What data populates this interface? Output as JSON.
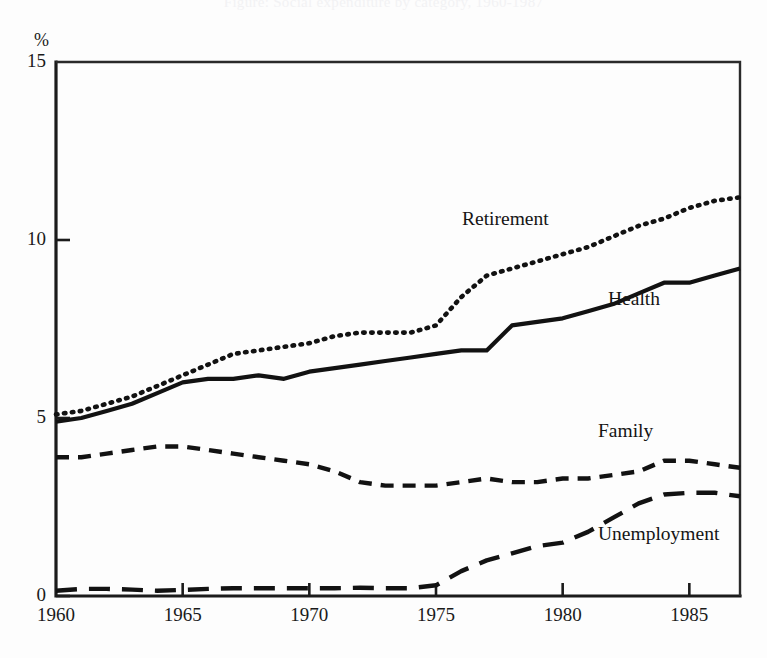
{
  "figure": {
    "cropped_title": "Figure: Social expenditure by category, 1960-1987",
    "percent_symbol": "%"
  },
  "chart_data": {
    "type": "line",
    "title": "",
    "subtitle": "",
    "xlabel": "",
    "ylabel": "%",
    "xlim": [
      1960,
      1987
    ],
    "ylim": [
      0,
      15
    ],
    "yticks": [
      0,
      5,
      10,
      15
    ],
    "xticks": [
      1960,
      1965,
      1970,
      1975,
      1980,
      1985
    ],
    "grid": false,
    "legend_position": "inline-annotations",
    "x": [
      1960,
      1961,
      1962,
      1963,
      1964,
      1965,
      1966,
      1967,
      1968,
      1969,
      1970,
      1971,
      1972,
      1973,
      1974,
      1975,
      1976,
      1977,
      1978,
      1979,
      1980,
      1981,
      1982,
      1983,
      1984,
      1985,
      1986,
      1987
    ],
    "series": [
      {
        "name": "Retirement",
        "style": "dotted",
        "label_x": 1972,
        "label_y": 10.2,
        "values": [
          5.1,
          5.2,
          5.4,
          5.6,
          5.9,
          6.2,
          6.5,
          6.8,
          6.9,
          7.0,
          7.1,
          7.3,
          7.4,
          7.4,
          7.4,
          7.6,
          8.4,
          9.0,
          9.2,
          9.4,
          9.6,
          9.8,
          10.1,
          10.4,
          10.6,
          10.9,
          11.1,
          11.2
        ]
      },
      {
        "name": "Health",
        "style": "solid",
        "label_x": 1981,
        "label_y": 8.6,
        "values": [
          4.9,
          5.0,
          5.2,
          5.4,
          5.7,
          6.0,
          6.1,
          6.1,
          6.2,
          6.1,
          6.3,
          6.4,
          6.5,
          6.6,
          6.7,
          6.8,
          6.9,
          6.9,
          7.6,
          7.7,
          7.8,
          8.0,
          8.2,
          8.5,
          8.8,
          8.8,
          9.0,
          9.2
        ]
      },
      {
        "name": "Family",
        "style": "short-dash",
        "label_x": 1980,
        "label_y": 4.4,
        "values": [
          3.9,
          3.9,
          4.0,
          4.1,
          4.2,
          4.2,
          4.1,
          4.0,
          3.9,
          3.8,
          3.7,
          3.5,
          3.2,
          3.1,
          3.1,
          3.1,
          3.2,
          3.3,
          3.2,
          3.2,
          3.3,
          3.3,
          3.4,
          3.5,
          3.8,
          3.8,
          3.7,
          3.6
        ]
      },
      {
        "name": "Unemployment",
        "style": "long-dash",
        "label_x": 1980,
        "label_y": 1.4,
        "values": [
          0.15,
          0.2,
          0.2,
          0.18,
          0.15,
          0.17,
          0.2,
          0.22,
          0.22,
          0.22,
          0.22,
          0.22,
          0.23,
          0.22,
          0.22,
          0.3,
          0.7,
          1.0,
          1.2,
          1.4,
          1.5,
          1.8,
          2.2,
          2.6,
          2.85,
          2.9,
          2.9,
          2.8
        ]
      }
    ]
  }
}
